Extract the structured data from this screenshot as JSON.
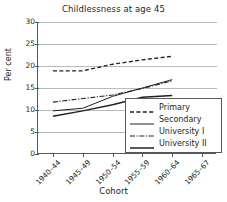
{
  "chart_data": {
    "type": "line",
    "title": "Childlessness at age 45",
    "xlabel": "Cohort",
    "ylabel": "Per cent",
    "categories": [
      "1940–44",
      "1945–49",
      "1950–54",
      "1955–59",
      "1960–64",
      "1965–67"
    ],
    "ylim": [
      0,
      30
    ],
    "yticks": [
      0,
      5,
      10,
      15,
      20,
      25,
      30
    ],
    "grid": true,
    "legend_position": "lower right",
    "series": [
      {
        "name": "Primary",
        "style": "dashed",
        "color": "#231f20",
        "values": [
          18.9,
          18.9,
          20.4,
          21.4,
          22.2,
          null
        ]
      },
      {
        "name": "Secondary",
        "style": "solid",
        "color": "#231f20",
        "values": [
          9.8,
          10.4,
          13.1,
          15.0,
          16.9,
          null
        ]
      },
      {
        "name": "University I",
        "style": "dash-dot",
        "color": "#231f20",
        "values": [
          11.8,
          12.6,
          13.4,
          14.9,
          16.6,
          null
        ]
      },
      {
        "name": "University II",
        "style": "solid-thick",
        "color": "#231f20",
        "values": [
          8.6,
          9.8,
          11.2,
          12.9,
          13.3,
          null
        ]
      }
    ]
  },
  "legend": {
    "items": [
      {
        "label": "Primary"
      },
      {
        "label": "Secondary"
      },
      {
        "label": "University I"
      },
      {
        "label": "University II"
      }
    ]
  }
}
